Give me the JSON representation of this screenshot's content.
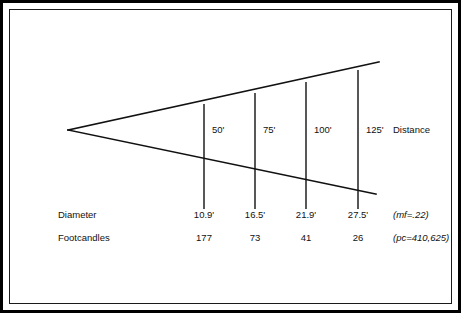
{
  "figure": {
    "ink_color": "#111111",
    "background_color": "#ffffff"
  },
  "chart_data": {
    "type": "diagram",
    "xlabel": "Distance",
    "ylabel": "",
    "grid": false,
    "legend": "none",
    "categories": [
      "50'",
      "75'",
      "100'",
      "125'"
    ],
    "distance_caption": "Distance",
    "rows": [
      {
        "label": "Diameter",
        "values": [
          "10.9'",
          "16.5'",
          "21.9'",
          "27.5'"
        ],
        "note": "(mf=.22)"
      },
      {
        "label": "Footcandles",
        "values": [
          "177",
          "73",
          "41",
          "26"
        ],
        "note": "(pc=410,625)"
      }
    ],
    "series": [
      {
        "name": "Distance (ft)",
        "values": [
          50,
          75,
          100,
          125
        ]
      },
      {
        "name": "Beam diameter (ft)",
        "values": [
          10.9,
          16.5,
          21.9,
          27.5
        ]
      },
      {
        "name": "Footcandles",
        "values": [
          177,
          73,
          41,
          26
        ]
      }
    ],
    "annotations": [
      "(mf=.22)",
      "(pc=410,625)"
    ]
  },
  "geometry": {
    "apex": {
      "x": 68,
      "y": 130
    },
    "upper_end": {
      "x": 379,
      "y": 62
    },
    "lower_end": {
      "x": 376,
      "y": 194
    },
    "stations": [
      {
        "label": "50'",
        "x": 204,
        "top_y": 104,
        "bottom_y": 209,
        "label_x": 212,
        "label_y": 133
      },
      {
        "label": "75'",
        "x": 255,
        "top_y": 93,
        "bottom_y": 209,
        "label_x": 263,
        "label_y": 133
      },
      {
        "label": "100'",
        "x": 306,
        "top_y": 82,
        "bottom_y": 209,
        "label_x": 314,
        "label_y": 133
      },
      {
        "label": "125'",
        "x": 358,
        "top_y": 70,
        "bottom_y": 209,
        "label_x": 366,
        "label_y": 133
      }
    ],
    "distance_caption_x": 393,
    "distance_caption_y": 133,
    "row_label_x": 58,
    "row_note_x": 393,
    "diameter_row_y": 218,
    "footcandles_row_y": 241
  }
}
